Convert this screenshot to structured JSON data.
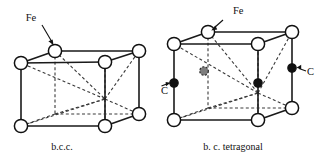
{
  "figure": {
    "background_color": "#ffffff",
    "line_color": "#111111",
    "dashed_color": "#3a3a3a",
    "width": 323,
    "height": 157
  },
  "panels": [
    {
      "id": "bcc",
      "caption": "b.c.c.",
      "annotations": [
        {
          "text": "Fe",
          "target": "top-back-left-corner-atom"
        }
      ],
      "atoms": {
        "open_circle_label": "Fe",
        "open_circle_count": 8,
        "filled_circle_label": "C",
        "filled_circle_count": 0
      }
    },
    {
      "id": "bct",
      "caption": "b. c. tetragonal",
      "annotations": [
        {
          "text": "Fe",
          "target": "top-back-left-corner-atom"
        },
        {
          "text": "C",
          "target": "front-left-edge-midpoint-atom"
        },
        {
          "text": "C",
          "target": "back-right-edge-midpoint-atom"
        }
      ],
      "atoms": {
        "open_circle_label": "Fe",
        "open_circle_count": 8,
        "filled_circle_label": "C",
        "filled_circle_count": 3
      }
    }
  ],
  "labels": {
    "fe_left": "Fe",
    "fe_right": "Fe",
    "c_left": "C",
    "c_right": "C",
    "caption_left": "b.c.c.",
    "caption_right": "b. c. tetragonal"
  },
  "icons": {
    "arrow": "arrow-icon",
    "open_atom": "open-circle-atom-icon",
    "filled_atom": "filled-circle-atom-icon",
    "center_atom": "hidden-center-atom-icon"
  }
}
